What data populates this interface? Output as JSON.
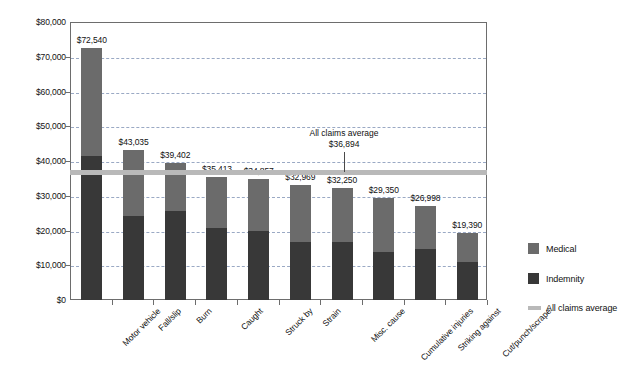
{
  "chart_data": {
    "type": "bar",
    "subtype": "stacked-bar",
    "title": "",
    "subtitle": "",
    "xlabel": "",
    "ylabel": "",
    "ylim": [
      0,
      80000
    ],
    "ytick_values": [
      0,
      10000,
      20000,
      30000,
      40000,
      50000,
      60000,
      70000,
      80000
    ],
    "ytick_labels": [
      "$0",
      "$10,000",
      "$20,000",
      "$30,000",
      "$40,000",
      "$50,000",
      "$60,000",
      "$70,000",
      "$80,000"
    ],
    "grid": true,
    "grid_axis": "y",
    "legend_position": "right",
    "categories": [
      "Motor vehicle",
      "Fall/slip",
      "Burn",
      "Caught",
      "Struck by",
      "Strain",
      "Misc. cause",
      "Cumulative injuries",
      "Striking against",
      "Cut/punch/scrape"
    ],
    "series": [
      {
        "name": "Indemnity",
        "color": "#383838",
        "values": [
          41500,
          24200,
          25700,
          20800,
          20000,
          16700,
          16700,
          13800,
          14600,
          11000
        ]
      },
      {
        "name": "Medical",
        "color": "#6b6b6b",
        "values": [
          31040,
          18835,
          13702,
          14613,
          14857,
          16269,
          15550,
          15550,
          12398,
          8390
        ]
      }
    ],
    "totals": [
      72540,
      43035,
      39402,
      35413,
      34857,
      32969,
      32250,
      29350,
      26998,
      19390
    ],
    "total_labels": [
      "$72,540",
      "$43,035",
      "$39,402",
      "$35,413",
      "$34,857",
      "$32,969",
      "$32,250",
      "$29,350",
      "$26,998",
      "$19,390"
    ],
    "reference_line": {
      "label": "All claims average",
      "value": 36894,
      "value_label": "$36,894",
      "color": "#b9b9b9"
    },
    "legend_entries": [
      {
        "label": "Medical",
        "color": "#6b6b6b",
        "marker": "square"
      },
      {
        "label": "Indemnity",
        "color": "#383838",
        "marker": "square"
      },
      {
        "label": "All claims average",
        "color": "#b9b9b9",
        "marker": "line"
      }
    ]
  },
  "colors": {
    "medical": "#6b6b6b",
    "indemnity": "#383838",
    "average_line": "#b9b9b9",
    "gridline": "#9aa9c4",
    "axis": "#6d6d6d",
    "text": "#111111",
    "background": "#ffffff"
  }
}
